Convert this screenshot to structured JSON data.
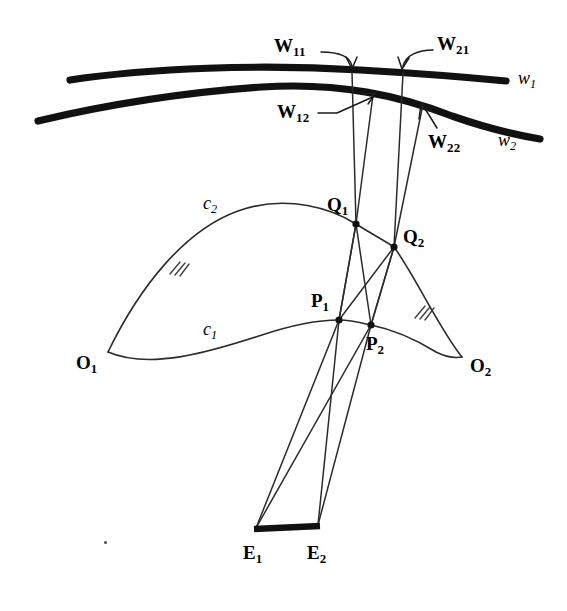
{
  "figure": {
    "background_color": "#ffffff",
    "ink_color": "#111111",
    "width": 567,
    "height": 611
  },
  "labels": {
    "w11": {
      "text": "W",
      "subscript": "11",
      "style": "bold"
    },
    "w21": {
      "text": "W",
      "subscript": "21",
      "style": "bold"
    },
    "w12": {
      "text": "W",
      "subscript": "12",
      "style": "bold"
    },
    "w22": {
      "text": "W",
      "subscript": "22",
      "style": "bold"
    },
    "w1_curve": {
      "text": "w",
      "subscript": "1",
      "style": "italic"
    },
    "w2_curve": {
      "text": "w",
      "subscript": "2",
      "style": "italic"
    },
    "q1": {
      "text": "Q",
      "subscript": "1",
      "style": "bold"
    },
    "q2": {
      "text": "Q",
      "subscript": "2",
      "style": "bold"
    },
    "p1": {
      "text": "P",
      "subscript": "1",
      "style": "bold"
    },
    "p2": {
      "text": "P",
      "subscript": "2",
      "style": "bold"
    },
    "o1": {
      "text": "O",
      "subscript": "1",
      "style": "bold"
    },
    "o2": {
      "text": "O",
      "subscript": "2",
      "style": "bold"
    },
    "e1": {
      "text": "E",
      "subscript": "1",
      "style": "bold"
    },
    "e2": {
      "text": "E",
      "subscript": "2",
      "style": "bold"
    },
    "c1_curve": {
      "text": "c",
      "subscript": "1",
      "style": "italic"
    },
    "c2_curve": {
      "text": "c",
      "subscript": "2",
      "style": "italic"
    }
  },
  "points": {
    "Q1": {
      "x": 356,
      "y": 224
    },
    "Q2": {
      "x": 394,
      "y": 247
    },
    "P1": {
      "x": 339,
      "y": 320
    },
    "P2": {
      "x": 371,
      "y": 325
    },
    "O1": {
      "x": 108,
      "y": 352
    },
    "O2": {
      "x": 462,
      "y": 357
    },
    "E1": {
      "x": 256,
      "y": 528
    },
    "E2": {
      "x": 318,
      "y": 525
    },
    "W11": {
      "x": 352,
      "y": 72
    },
    "W21": {
      "x": 403,
      "y": 73
    },
    "W12": {
      "x": 373,
      "y": 95
    },
    "W22": {
      "x": 423,
      "y": 104
    }
  },
  "curves": {
    "w1": {
      "name": "image-plane-curve-w1",
      "kind": "thick"
    },
    "w2": {
      "name": "image-plane-curve-w2",
      "kind": "thick"
    },
    "c1": {
      "name": "space-curve-c1",
      "kind": "thin"
    },
    "c2": {
      "name": "space-curve-c2",
      "kind": "thin"
    }
  },
  "annotations": {
    "hatch_left": {
      "x": 175,
      "y": 268
    },
    "hatch_right": {
      "x": 420,
      "y": 312
    }
  }
}
